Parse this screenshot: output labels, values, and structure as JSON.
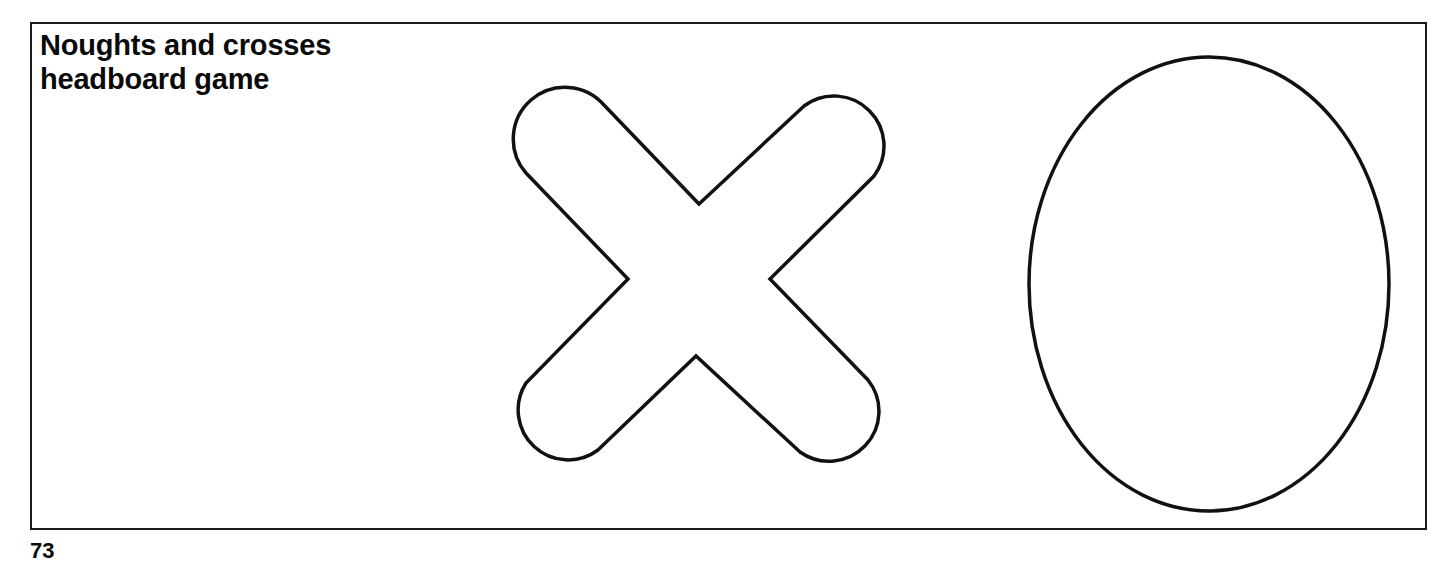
{
  "diagram": {
    "title_lines": [
      "Noughts and crosses",
      "headboard game"
    ],
    "shapes": [
      {
        "name": "cross",
        "label": "X"
      },
      {
        "name": "nought",
        "label": "O"
      }
    ],
    "stroke_color": "#111111",
    "background_color": "#ffffff",
    "footer_fragment": "73"
  }
}
